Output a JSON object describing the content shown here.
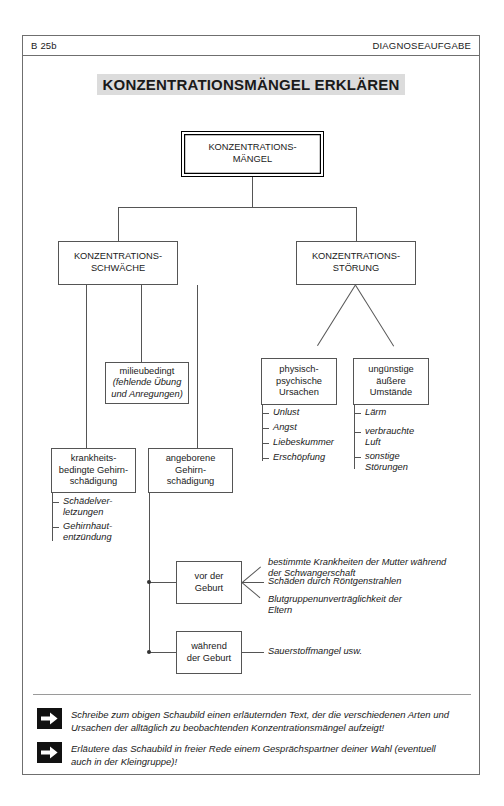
{
  "header": {
    "code": "B 25b",
    "kind": "DIAGNOSEAUFGABE"
  },
  "title": "KONZENTRATIONSMÄNGEL ERKLÄREN",
  "nodes": {
    "root": {
      "line1": "KONZENTRATIONS-",
      "line2": "MÄNGEL"
    },
    "schwaeche": {
      "line1": "KONZENTRATIONS-",
      "line2": "SCHWÄCHE"
    },
    "stoerung": {
      "line1": "KONZENTRATIONS-",
      "line2": "STÖRUNG"
    },
    "milieu": {
      "line1": "milieubedingt",
      "line2": "(fehlende Übung",
      "line3": "und Anregungen)"
    },
    "krankheit": {
      "line1": "krankheits-",
      "line2": "bedingte Gehirn-",
      "line3": "schädigung"
    },
    "angeboren": {
      "line1": "angeborene",
      "line2": "Gehirn-",
      "line3": "schädigung"
    },
    "physisch": {
      "line1": "physisch-",
      "line2": "psychische",
      "line3": "Ursachen"
    },
    "umstaende": {
      "line1": "ungünstige",
      "line2": "äußere",
      "line3": "Umstände"
    },
    "vorgeburt": {
      "line1": "vor der",
      "line2": "Geburt"
    },
    "waehrend": {
      "line1": "während",
      "line2": "der Geburt"
    }
  },
  "lists": {
    "krankheit_items": [
      {
        "line1": "Schädelver-",
        "line2": "letzungen"
      },
      {
        "line1": "Gehirnhaut-",
        "line2": "entzündung"
      }
    ],
    "physisch_items": [
      {
        "line1": "Unlust"
      },
      {
        "line1": "Angst"
      },
      {
        "line1": "Liebeskummer"
      },
      {
        "line1": "Erschöpfung"
      }
    ],
    "umstaende_items": [
      {
        "line1": "Lärm"
      },
      {
        "line1": "verbrauchte",
        "line2": "Luft"
      },
      {
        "line1": "sonstige",
        "line2": "Störungen"
      }
    ],
    "vorgeburt_items": [
      {
        "line1": "bestimmte Krankheiten der Mutter während",
        "line2": "der Schwangerschaft"
      },
      {
        "line1": "Schäden durch Röntgenstrahlen"
      },
      {
        "line1": "Blutgruppenunverträglichkeit der",
        "line2": "Eltern"
      }
    ],
    "waehrend_items": [
      {
        "line1": "Sauerstoffmangel usw."
      }
    ]
  },
  "tasks": [
    {
      "icon": "arrow-right-icon",
      "line1": "Schreibe zum obigen Schaubild einen erläuternden Text, der die verschiedenen Arten",
      "line2": "und Ursachen der alltäglich zu beobachtenden Konzentrationsmängel aufzeigt!"
    },
    {
      "icon": "arrow-right-icon",
      "line1": "Erläutere das Schaubild in freier Rede einem Gesprächspartner deiner Wahl",
      "line2": "(eventuell auch in der Kleingruppe)!"
    }
  ],
  "colors": {
    "line": "#555555",
    "frame": "#6f6f6f",
    "highlight": "#dcdcdc",
    "ink": "#1a1a1a"
  }
}
